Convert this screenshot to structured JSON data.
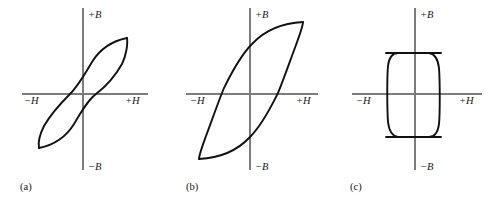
{
  "figure": {
    "background_color": "#ffffff",
    "curve_color": "#111111",
    "axis_color": "#7d7d7d",
    "label_color": "#161616",
    "width": 497,
    "height": 206
  },
  "chart_data": {
    "type": "line",
    "xlabel": "H",
    "ylabel": "B",
    "grid": false,
    "legend": null,
    "axis_tick_labels": {
      "x_negative": "−H",
      "x_positive": "+H",
      "y_positive": "+B",
      "y_negative": "−B"
    },
    "panels": [
      {
        "id": "a",
        "caption": "(a)",
        "description": "Narrow soft-magnetic hysteresis loop, low coercivity and low remanence",
        "origin": {
          "x": 83,
          "y": 94
        },
        "x_axis": {
          "x1": 22,
          "x2": 148,
          "y": 94
        },
        "y_axis": {
          "x": 83,
          "y1": 8,
          "y2": 170
        },
        "loop_extent": {
          "x_min": 39,
          "x_max": 127,
          "y_min": 38,
          "y_max": 148
        },
        "saturation_points": [
          {
            "x": 127,
            "y": 38
          },
          {
            "x": 39,
            "y": 148
          }
        ],
        "coercivity_points": [
          {
            "x": 70,
            "y": 94
          },
          {
            "x": 96,
            "y": 94
          }
        ],
        "remanence_points": [
          {
            "x": 83,
            "y": 80
          },
          {
            "x": 83,
            "y": 107
          }
        ],
        "upper_branch_path": "M 127 38 C 112 41 100 49 92 62 C 85 74 78 86 70 94 C 62 102 52 112 44 126 C 40 134 38 143 39 148",
        "lower_branch_path": "M 39 148 C 54 145 66 137 74 124 C 81 112 88 100 96 94 C 104 88 114 78 122 64 C 126 56 128 44 127 38",
        "labels": {
          "x_negative": {
            "text": "−H",
            "x": 24,
            "y": 104
          },
          "x_positive": {
            "text": "+H",
            "x": 125,
            "y": 104
          },
          "y_positive": {
            "text": "+B",
            "x": 88,
            "y": 18
          },
          "y_negative": {
            "text": "−B",
            "x": 88,
            "y": 170
          },
          "caption": {
            "text": "(a)",
            "x": 20,
            "y": 190
          }
        }
      },
      {
        "id": "b",
        "caption": "(b)",
        "description": "Wide hysteresis loop with larger area, higher coercivity and remanence",
        "origin": {
          "x": 250,
          "y": 94
        },
        "x_axis": {
          "x1": 186,
          "x2": 318,
          "y": 94
        },
        "y_axis": {
          "x": 250,
          "y1": 8,
          "y2": 170
        },
        "loop_extent": {
          "x_min": 199,
          "x_max": 303,
          "y_min": 22,
          "y_max": 159
        },
        "saturation_points": [
          {
            "x": 303,
            "y": 22
          },
          {
            "x": 199,
            "y": 159
          }
        ],
        "coercivity_points": [
          {
            "x": 222,
            "y": 94
          },
          {
            "x": 279,
            "y": 94
          }
        ],
        "remanence_points": [
          {
            "x": 250,
            "y": 62
          },
          {
            "x": 250,
            "y": 125
          }
        ],
        "upper_branch_path": "M 303 22 C 283 23 265 30 252 44 C 239 57 230 76 224 88 C 219 100 212 120 206 136 C 202 147 199 155 199 159",
        "lower_branch_path": "M 199 159 C 219 158 237 151 250 137 C 263 124 272 105 278 93 C 283 81 290 61 296 45 C 300 34 303 26 303 22",
        "labels": {
          "x_negative": {
            "text": "−H",
            "x": 190,
            "y": 104
          },
          "x_positive": {
            "text": "+H",
            "x": 296,
            "y": 104
          },
          "y_positive": {
            "text": "+B",
            "x": 255,
            "y": 18
          },
          "y_negative": {
            "text": "−B",
            "x": 255,
            "y": 170
          },
          "caption": {
            "text": "(b)",
            "x": 186,
            "y": 190
          }
        }
      },
      {
        "id": "c",
        "caption": "(c)",
        "description": "Nearly rectangular square hysteresis loop, high remanence ratio",
        "origin": {
          "x": 415,
          "y": 94
        },
        "x_axis": {
          "x1": 352,
          "x2": 482,
          "y": 94
        },
        "y_axis": {
          "x": 415,
          "y1": 8,
          "y2": 170
        },
        "loop_extent": {
          "x_min": 386,
          "x_max": 441,
          "y_min": 53,
          "y_max": 137
        },
        "saturation_points": [
          {
            "x": 441,
            "y": 53
          },
          {
            "x": 386,
            "y": 137
          }
        ],
        "coercivity_points": [
          {
            "x": 390,
            "y": 94
          },
          {
            "x": 437,
            "y": 94
          }
        ],
        "remanence_points": [
          {
            "x": 415,
            "y": 55
          },
          {
            "x": 415,
            "y": 135
          }
        ],
        "upper_branch_path": "M 441 53 L 398 53 C 392 53 389 58 388 66 C 387 76 387 108 388 122 C 389 131 392 136 398 137 L 441 137",
        "lower_branch_path": "M 386 137 L 429 137 C 435 137 438 132 439 124 C 440 114 440 82 439 68 C 438 59 435 54 429 53 L 386 53",
        "labels": {
          "x_negative": {
            "text": "−H",
            "x": 356,
            "y": 104
          },
          "x_positive": {
            "text": "+H",
            "x": 459,
            "y": 104
          },
          "y_positive": {
            "text": "+B",
            "x": 420,
            "y": 18
          },
          "y_negative": {
            "text": "−B",
            "x": 420,
            "y": 170
          },
          "caption": {
            "text": "(c)",
            "x": 350,
            "y": 190
          }
        }
      }
    ]
  }
}
